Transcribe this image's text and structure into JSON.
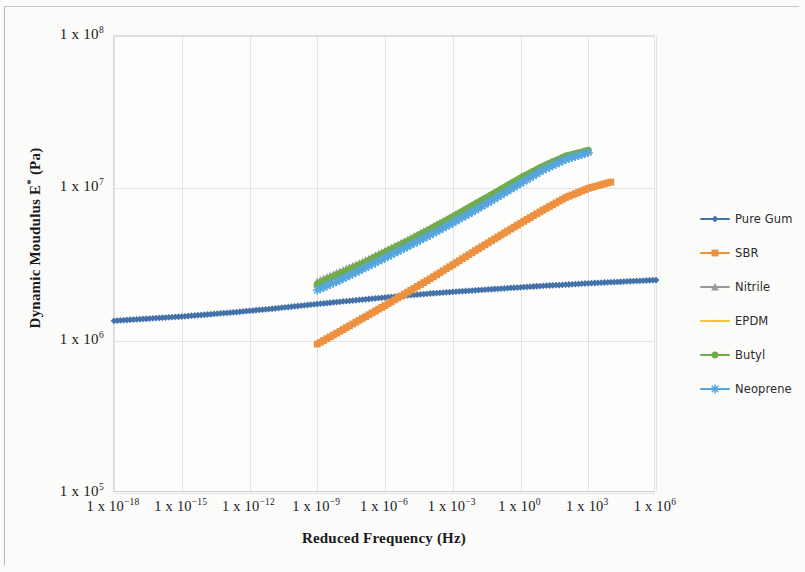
{
  "chart_data": {
    "type": "scatter",
    "title": "",
    "xlabel": "Reduced Frequency (Hz)",
    "ylabel": "Dynamic Moudulus E* (Pa)",
    "xscale": "log",
    "yscale": "log",
    "xlim": [
      1e-18,
      1000000.0
    ],
    "ylim": [
      100000.0,
      100000000.0
    ],
    "grid": true,
    "legend_position": "right-outside",
    "xticks": [
      "1 x 10-18",
      "1 x 10-15",
      "1 x 10-12",
      "1 x 10-9",
      "1 x 10-6",
      "1 x 10-3",
      "1 x 100",
      "1 x 103",
      "1 x 106"
    ],
    "yticks": [
      "1 x 105",
      "1 x 106",
      "1 x 107",
      "1 x 108"
    ],
    "series": [
      {
        "name": "Pure Gum",
        "color": "#4472a8",
        "marker": "diamond",
        "x": [
          1e-18,
          1e-17,
          1e-16,
          1e-15,
          1e-14,
          1e-13,
          1e-12,
          1e-11,
          1e-10,
          1e-09,
          1e-08,
          1e-07,
          1e-06,
          1e-05,
          0.0001,
          0.001,
          0.01,
          0.1,
          1.0,
          10.0,
          100.0,
          1000.0,
          10000.0,
          100000.0,
          1000000.0
        ],
        "y": [
          1350000,
          1380000,
          1410000,
          1440000,
          1480000,
          1520000,
          1570000,
          1620000,
          1680000,
          1740000,
          1800000,
          1860000,
          1920000,
          1980000,
          2040000,
          2090000,
          2140000,
          2190000,
          2240000,
          2290000,
          2330000,
          2380000,
          2420000,
          2460000,
          2500000
        ]
      },
      {
        "name": "SBR",
        "color": "#ed9141",
        "marker": "square",
        "x": [
          1e-09,
          1e-08,
          1e-07,
          1e-06,
          1e-05,
          0.0001,
          0.001,
          0.01,
          0.1,
          1.0,
          10.0,
          100.0,
          1000.0,
          10000.0
        ],
        "y": [
          950000,
          1150000,
          1400000,
          1700000,
          2080000,
          2550000,
          3150000,
          3900000,
          4800000,
          5900000,
          7200000,
          8700000,
          10000000,
          11000000
        ]
      },
      {
        "name": "Nitrile",
        "color": "#9a9a9a",
        "marker": "triangle",
        "x": [
          1e-09,
          1e-08,
          1e-07,
          1e-06,
          1e-05,
          0.0001,
          0.001,
          0.01,
          0.1,
          1.0,
          10.0,
          100.0,
          1000.0
        ],
        "y": [
          2450000,
          2850000,
          3300000,
          3900000,
          4600000,
          5500000,
          6600000,
          8000000,
          9700000,
          11800000,
          14000000,
          16200000,
          17500000
        ]
      },
      {
        "name": "EPDM",
        "color": "#f2c537",
        "marker": "dash",
        "x": [
          1e-09,
          1e-08,
          1e-07,
          1e-06,
          1e-05,
          0.0001,
          0.001,
          0.01,
          0.1,
          1.0,
          10.0,
          100.0,
          1000.0
        ],
        "y": [
          2300000,
          2700000,
          3150000,
          3700000,
          4400000,
          5250000,
          6300000,
          7600000,
          9200000,
          11200000,
          13500000,
          15600000,
          17000000
        ]
      },
      {
        "name": "Butyl",
        "color": "#71ad47",
        "marker": "circle",
        "x": [
          1e-09,
          1e-08,
          1e-07,
          1e-06,
          1e-05,
          0.0001,
          0.001,
          0.01,
          0.1,
          1.0,
          10.0,
          100.0,
          1000.0
        ],
        "y": [
          2350000,
          2750000,
          3200000,
          3800000,
          4500000,
          5400000,
          6500000,
          7900000,
          9600000,
          11700000,
          14000000,
          16300000,
          17800000
        ]
      },
      {
        "name": "Neoprene",
        "color": "#56a5dd",
        "marker": "star",
        "x": [
          1e-09,
          1e-08,
          1e-07,
          1e-06,
          1e-05,
          0.0001,
          0.001,
          0.01,
          0.1,
          1.0,
          10.0,
          100.0,
          1000.0
        ],
        "y": [
          2150000,
          2500000,
          2950000,
          3500000,
          4150000,
          4950000,
          5950000,
          7200000,
          8800000,
          10800000,
          13200000,
          15500000,
          17200000
        ]
      }
    ]
  }
}
